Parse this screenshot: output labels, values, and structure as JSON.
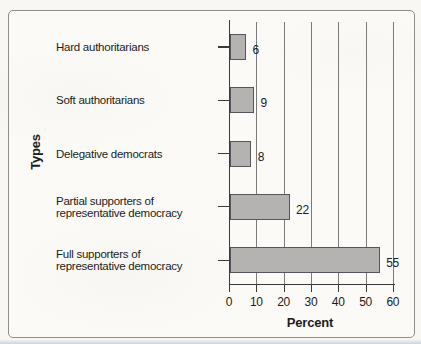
{
  "figure": {
    "title": "",
    "ylabel": "Types",
    "xlabel": "Percent"
  },
  "chart_data": {
    "type": "bar",
    "orientation": "horizontal",
    "title": "",
    "xlabel": "Percent",
    "ylabel": "Types",
    "categories": [
      "Hard authoritarians",
      "Soft authoritarians",
      "Delegative democrats",
      "Partial supporters of\nrepresentative democracy",
      "Full supporters of\nrepresentative democracy"
    ],
    "values": [
      6,
      9,
      8,
      22,
      55
    ],
    "value_labels": [
      "6",
      "9",
      "8",
      "22",
      "55"
    ],
    "xlim": [
      0,
      60
    ],
    "xticks": [
      0,
      10,
      20,
      30,
      40,
      50,
      60
    ],
    "xtick_labels": [
      "0",
      "10",
      "20",
      "30",
      "40",
      "50",
      "60"
    ],
    "grid": true,
    "legend": "none",
    "colors": {
      "bar_fill": "#b4b3b1",
      "bar_border": "#55555c",
      "gridline": "#7b7b7b",
      "axis": "#3a3a3a",
      "text": "#1c1c1c",
      "frame_border": "#8f8f8f",
      "background": "#f8f7f4"
    }
  }
}
